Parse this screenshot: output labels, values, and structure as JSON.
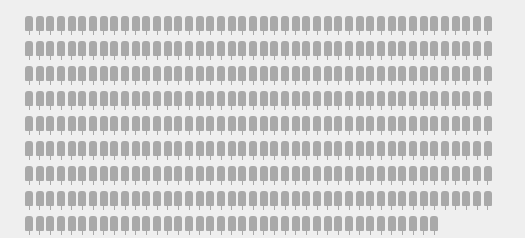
{
  "pictogram": {
    "icon": "popsicle-icon",
    "icon_color": "#a9a9a9",
    "background_color": "#efefef",
    "total_count": 391,
    "per_row": 44,
    "rows": 9,
    "last_row_count": 39,
    "layout": {
      "origin_x": 25,
      "origin_y": 16,
      "pitch_x": 10.67,
      "pitch_y": 25
    }
  }
}
